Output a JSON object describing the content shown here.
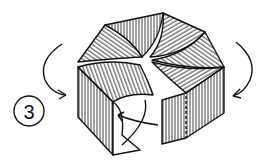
{
  "diagram": {
    "type": "origami-folding-step",
    "step_number": "3",
    "elements": [
      {
        "name": "step-badge",
        "text": "3"
      },
      {
        "name": "curved-arrow-left",
        "direction": "down-right"
      },
      {
        "name": "curved-arrow-right",
        "direction": "down-left"
      },
      {
        "name": "curved-arrow-inner",
        "direction": "tuck-left"
      },
      {
        "name": "hexagonal-box",
        "description": "folded paper model with striped shading"
      }
    ],
    "colors": {
      "ink": "#111111",
      "paper": "#ffffff"
    }
  }
}
